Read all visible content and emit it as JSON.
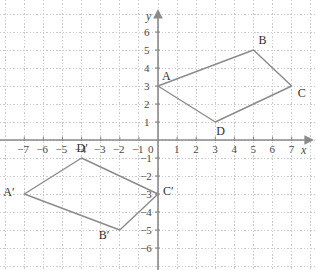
{
  "figure": {
    "kind": "coordinate-plane-transformation",
    "background_color": "#ffffff",
    "grid_color": "#c9c9c9",
    "axis_color": "#8a8a8a",
    "shape_color": "#8b8b8b",
    "label_color": "#2e2e2e"
  },
  "axes": {
    "x_axis_name": "x",
    "y_axis_name": "y",
    "origin_label": "0",
    "x_ticks": [
      "−7",
      "−6",
      "−5",
      "−4",
      "−3",
      "−2",
      "−1"
    ],
    "x_ticks_positive": [
      "1",
      "2",
      "3",
      "4",
      "5",
      "6",
      "7"
    ],
    "y_ticks_positive": [
      "1",
      "2",
      "3",
      "4",
      "5",
      "6"
    ],
    "y_ticks_negative": [
      "−1",
      "−2",
      "−3",
      "−4",
      "−5",
      "−6"
    ],
    "xlim": [
      -7.8,
      8.2
    ],
    "ylim": [
      -7.2,
      7.3
    ]
  },
  "chart_data": {
    "type": "scatter",
    "title": "",
    "xlabel": "x",
    "ylabel": "y",
    "xlim": [
      -7.8,
      8.2
    ],
    "ylim": [
      -7.2,
      7.3
    ],
    "grid": true,
    "legend": "none",
    "series": [
      {
        "name": "Quadrilateral ABCD",
        "closed": true,
        "points": [
          {
            "label": "A",
            "x": 0,
            "y": 3
          },
          {
            "label": "B",
            "x": 5,
            "y": 5
          },
          {
            "label": "C",
            "x": 7,
            "y": 3
          },
          {
            "label": "D",
            "x": 3,
            "y": 1
          }
        ]
      },
      {
        "name": "Quadrilateral A'B'C'D'",
        "closed": true,
        "points": [
          {
            "label": "A′",
            "x": -7,
            "y": -3
          },
          {
            "label": "B′",
            "x": -2,
            "y": -5
          },
          {
            "label": "C′",
            "x": 0,
            "y": -3
          },
          {
            "label": "D′",
            "x": -4,
            "y": -1
          }
        ]
      }
    ]
  },
  "vertex_labels": [
    {
      "text": "A",
      "x": 0,
      "y": 3,
      "dx": 4,
      "dy": -16
    },
    {
      "text": "B",
      "x": 5,
      "y": 5,
      "dx": 5,
      "dy": -16
    },
    {
      "text": "C",
      "x": 7,
      "y": 3,
      "dx": 6,
      "dy": 1
    },
    {
      "text": "D",
      "x": 3,
      "y": 1,
      "dx": 1,
      "dy": 3
    },
    {
      "text": "A′",
      "x": -7,
      "y": -3,
      "dx": -21,
      "dy": -8
    },
    {
      "text": "B′",
      "x": -2,
      "y": -5,
      "dx": -21,
      "dy": -1
    },
    {
      "text": "C′",
      "x": 0,
      "y": -3,
      "dx": 5,
      "dy": -9
    },
    {
      "text": "D′",
      "x": -4,
      "y": -1,
      "dx": -5,
      "dy": -16
    }
  ]
}
